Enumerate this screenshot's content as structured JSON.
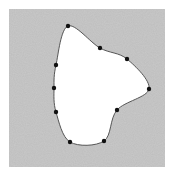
{
  "diagram": {
    "type": "closed-curve-through-control-points",
    "background_color": "#ffffff",
    "field": {
      "x": 9,
      "y": 9,
      "width": 156,
      "height": 158,
      "color": "#bdbdbd"
    },
    "shape_fill": "#ffffff",
    "curve_color": "#555555",
    "point_color": "#111111",
    "points": [
      {
        "x": 68,
        "y": 26
      },
      {
        "x": 100,
        "y": 48
      },
      {
        "x": 127,
        "y": 59
      },
      {
        "x": 149,
        "y": 89
      },
      {
        "x": 117,
        "y": 110
      },
      {
        "x": 104,
        "y": 141
      },
      {
        "x": 70,
        "y": 142
      },
      {
        "x": 56,
        "y": 112
      },
      {
        "x": 54,
        "y": 88
      },
      {
        "x": 56,
        "y": 65
      }
    ]
  }
}
